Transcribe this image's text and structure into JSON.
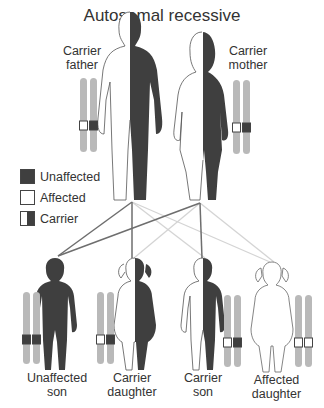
{
  "title": "Autosomal recessive",
  "colors": {
    "dark": "#3f3f3f",
    "chromosome": "#b9b9b9",
    "line_dark": "#6e6e6e",
    "line_light": "#d4d4d4",
    "outline": "#555555"
  },
  "parents": [
    {
      "label_line1": "Carrier",
      "label_line2": "father",
      "status": "carrier",
      "alleles": [
        "white",
        "dark"
      ]
    },
    {
      "label_line1": "Carrier",
      "label_line2": "mother",
      "status": "carrier",
      "alleles": [
        "white",
        "dark"
      ]
    }
  ],
  "legend": [
    {
      "label": "Unaffected",
      "swatch": "dark"
    },
    {
      "label": "Affected",
      "swatch": "white"
    },
    {
      "label": "Carrier",
      "swatch": "half"
    }
  ],
  "children": [
    {
      "label_line1": "Unaffected",
      "label_line2": "son",
      "status": "unaffected",
      "alleles": [
        "dark",
        "dark"
      ]
    },
    {
      "label_line1": "Carrier",
      "label_line2": "daughter",
      "status": "carrier",
      "alleles": [
        "white",
        "dark"
      ]
    },
    {
      "label_line1": "Carrier",
      "label_line2": "son",
      "status": "carrier",
      "alleles": [
        "white",
        "dark"
      ]
    },
    {
      "label_line1": "Affected",
      "label_line2": "daughter",
      "status": "affected",
      "alleles": [
        "white",
        "white"
      ]
    }
  ]
}
